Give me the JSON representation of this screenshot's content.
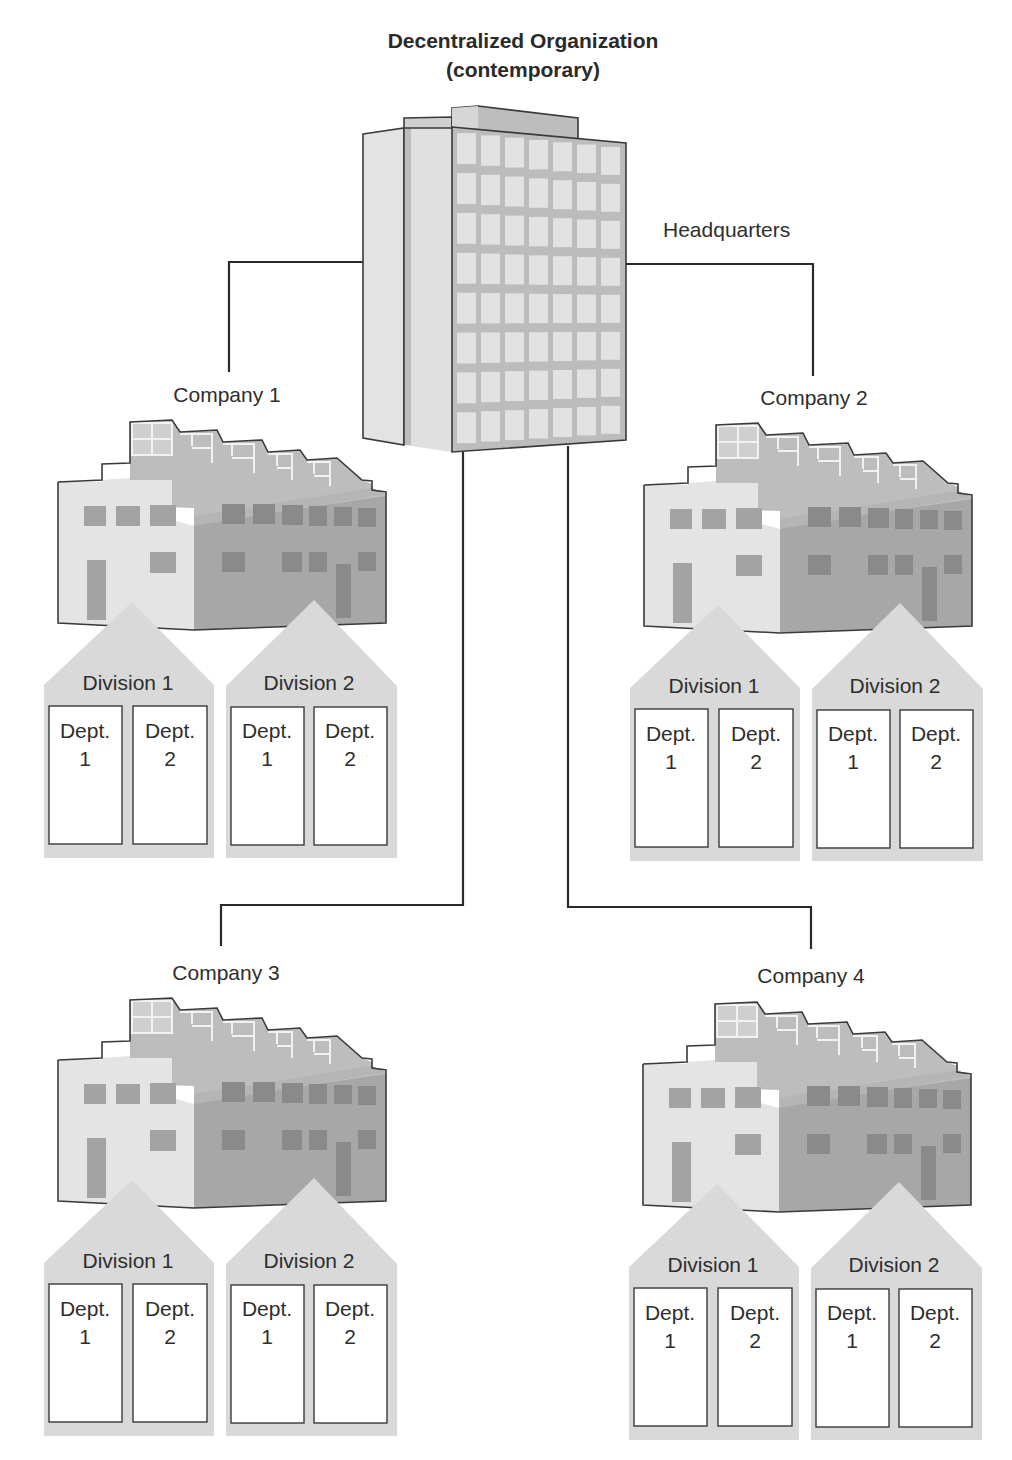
{
  "title": {
    "line1": "Decentralized Organization",
    "line2": "(contemporary)"
  },
  "headquarters": {
    "label": "Headquarters",
    "icon": "office-tower-icon"
  },
  "colors": {
    "line": "#2a2a2a",
    "building_light": "#e6e6e6",
    "building_mid": "#cfcfcf",
    "building_dark": "#a9a9a9",
    "window_dark": "#8f8f8f",
    "division_fill": "#d9d9d9",
    "dept_fill": "#ffffff"
  },
  "companies": [
    {
      "name": "Company 1",
      "icon": "factory-icon",
      "divisions": [
        {
          "name": "Division 1",
          "departments": [
            {
              "line1": "Dept.",
              "line2": "1"
            },
            {
              "line1": "Dept.",
              "line2": "2"
            }
          ]
        },
        {
          "name": "Division 2",
          "departments": [
            {
              "line1": "Dept.",
              "line2": "1"
            },
            {
              "line1": "Dept.",
              "line2": "2"
            }
          ]
        }
      ]
    },
    {
      "name": "Company 2",
      "icon": "factory-icon",
      "divisions": [
        {
          "name": "Division 1",
          "departments": [
            {
              "line1": "Dept.",
              "line2": "1"
            },
            {
              "line1": "Dept.",
              "line2": "2"
            }
          ]
        },
        {
          "name": "Division 2",
          "departments": [
            {
              "line1": "Dept.",
              "line2": "1"
            },
            {
              "line1": "Dept.",
              "line2": "2"
            }
          ]
        }
      ]
    },
    {
      "name": "Company 3",
      "icon": "factory-icon",
      "divisions": [
        {
          "name": "Division 1",
          "departments": [
            {
              "line1": "Dept.",
              "line2": "1"
            },
            {
              "line1": "Dept.",
              "line2": "2"
            }
          ]
        },
        {
          "name": "Division 2",
          "departments": [
            {
              "line1": "Dept.",
              "line2": "1"
            },
            {
              "line1": "Dept.",
              "line2": "2"
            }
          ]
        }
      ]
    },
    {
      "name": "Company 4",
      "icon": "factory-icon",
      "divisions": [
        {
          "name": "Division 1",
          "departments": [
            {
              "line1": "Dept.",
              "line2": "1"
            },
            {
              "line1": "Dept.",
              "line2": "2"
            }
          ]
        },
        {
          "name": "Division 2",
          "departments": [
            {
              "line1": "Dept.",
              "line2": "1"
            },
            {
              "line1": "Dept.",
              "line2": "2"
            }
          ]
        }
      ]
    }
  ]
}
